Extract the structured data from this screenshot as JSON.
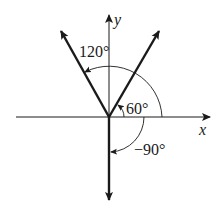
{
  "diagram": {
    "type": "angle-diagram",
    "axes": {
      "x_label": "x",
      "y_label": "y"
    },
    "angles": [
      {
        "label": "120°",
        "degrees": 120
      },
      {
        "label": "60°",
        "degrees": 60
      },
      {
        "label": "−90°",
        "degrees": -90
      }
    ],
    "colors": {
      "ink": "#1a1a1a",
      "background": "#ffffff"
    }
  }
}
